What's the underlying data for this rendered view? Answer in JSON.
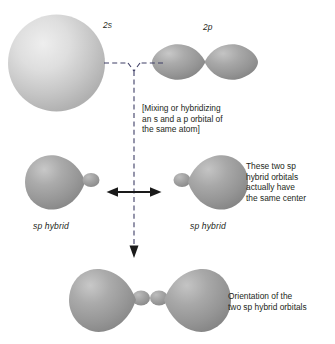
{
  "figure": {
    "background_color": "#ffffff",
    "orbital_fill": "#9a9a9a",
    "orbital_highlight": "#d8d8d8",
    "sphere_fill": "#c9c9c9",
    "line_color": "#3a3a66",
    "text_color": "#231f20"
  },
  "labels": {
    "s_orbital": "2s",
    "p_orbital": "2p",
    "sp_hybrid_left": "sp hybrid",
    "sp_hybrid_right": "sp hybrid"
  },
  "annotations": {
    "mixing_note": {
      "lines": [
        "[Mixing or hybridizing",
        "an s and a p orbital of",
        "the same atom]"
      ]
    },
    "same_center_note": {
      "lines": [
        "These two sp",
        "hybrid orbitals",
        "actually have",
        "the same center"
      ]
    },
    "orientation_note": {
      "lines": [
        "Orientation of the",
        "two sp hybrid orbitals"
      ]
    }
  },
  "shapes": {
    "s_orbital_sphere": "large light-gray sphere representing the 2s atomic orbital",
    "p_orbital_dumbbell": "two-lobe dumbbell representing the 2p atomic orbital",
    "sp_hybrid_left_lobe": "sp hybrid orbital with large lobe pointing left",
    "sp_hybrid_right_lobe": "sp hybrid orbital with large lobe pointing right",
    "combined_sp_pair": "two sp hybrid orbitals superimposed on the same center, pointing 180 degrees apart"
  },
  "connectors": {
    "y_junction": "dashed Y connecting the 2s and 2p orbitals",
    "vertical_dashed": "dashed vertical line ending in a downward arrow",
    "double_arrow": "horizontal double-headed arrow between the two sp hybrid orbitals"
  }
}
